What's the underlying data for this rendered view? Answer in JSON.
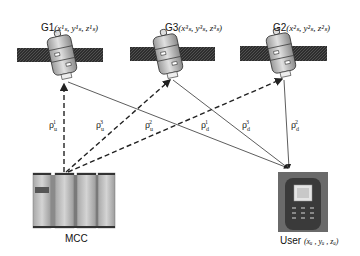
{
  "satellites": [
    {
      "id": "G1",
      "label": "G1",
      "coords": "(x¹ₛ, y¹ₛ, z¹ₛ)",
      "sup": "1",
      "cx": 62
    },
    {
      "id": "G3",
      "label": "G3",
      "coords": "(x³ₛ, y³ₛ, z³ₛ)",
      "sup": "3",
      "cx": 170
    },
    {
      "id": "G2",
      "label": "G2",
      "coords": "(x²ₛ, y²ₛ, z²ₛ)",
      "sup": "2",
      "cx": 283
    }
  ],
  "ground": {
    "mcc": {
      "label": "MCC"
    },
    "user": {
      "label": "User",
      "coords": "(xᵤ , yᵤ , zᵤ)"
    }
  },
  "links": {
    "uplink": [
      {
        "label": "ρ",
        "sub": "u",
        "sup": "1",
        "style": "dashed"
      },
      {
        "label": "ρ",
        "sub": "u",
        "sup": "3",
        "style": "dashed"
      },
      {
        "label": "ρ",
        "sub": "u",
        "sup": "2",
        "style": "dashed"
      }
    ],
    "downlink": [
      {
        "label": "ρ",
        "sub": "d",
        "sup": "1",
        "style": "solid"
      },
      {
        "label": "ρ",
        "sub": "d",
        "sup": "3",
        "style": "solid"
      },
      {
        "label": "ρ",
        "sub": "d",
        "sup": "2",
        "style": "solid"
      }
    ]
  },
  "colors": {
    "line": "#333333",
    "panel": "#2a2a2a",
    "body": "#b8b8b8"
  }
}
